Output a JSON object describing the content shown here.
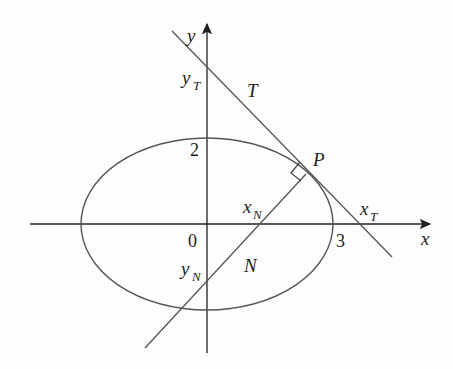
{
  "figure": {
    "type": "ellipse tangent and normal diagram",
    "labels": {
      "x_axis": "x",
      "y_axis": "y",
      "origin": "0",
      "tick_x": "3",
      "tick_y": "2",
      "point": "P",
      "tangent": "T",
      "normal": "N",
      "x_T_base": "x",
      "x_T_sub": "T",
      "y_T_base": "y",
      "y_T_sub": "T",
      "x_N_base": "x",
      "x_N_sub": "N",
      "y_N_base": "y",
      "y_N_sub": "N"
    },
    "colors": {
      "axis": "#231f20",
      "curve": "#555555",
      "text": "#231f20"
    }
  }
}
